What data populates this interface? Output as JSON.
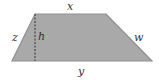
{
  "figure": {
    "shape": "trapezoid",
    "colors": {
      "fill": "#a9a9a9",
      "stroke": "#8a8a8a",
      "dashed_line": "#333333",
      "label": "#333333"
    },
    "labels": {
      "top_side": "x",
      "bottom_side": "y",
      "left_side": "z",
      "right_side": "w",
      "height": "h"
    }
  }
}
